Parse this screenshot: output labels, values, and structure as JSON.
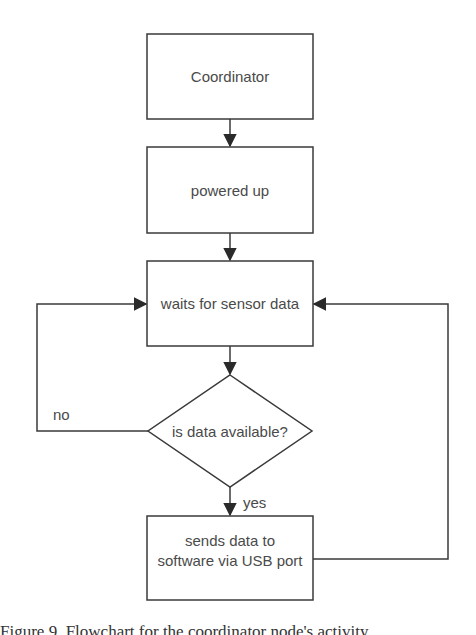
{
  "diagram": {
    "type": "flowchart",
    "colors": {
      "stroke": "#3a3a3a",
      "text": "#4a4a4a",
      "background": "#ffffff"
    },
    "nodes": [
      {
        "id": "n1",
        "shape": "rectangle",
        "label": "Coordinator"
      },
      {
        "id": "n2",
        "shape": "rectangle",
        "label": "powered up"
      },
      {
        "id": "n3",
        "shape": "rectangle",
        "label": "waits for sensor data"
      },
      {
        "id": "n4",
        "shape": "diamond",
        "label": "is data available?"
      },
      {
        "id": "n5",
        "shape": "rectangle",
        "label_lines": [
          "sends data to",
          "software via USB port"
        ]
      }
    ],
    "edges": [
      {
        "from": "n1",
        "to": "n2",
        "label": ""
      },
      {
        "from": "n2",
        "to": "n3",
        "label": ""
      },
      {
        "from": "n3",
        "to": "n4",
        "label": ""
      },
      {
        "from": "n4",
        "to": "n5",
        "label": "yes"
      },
      {
        "from": "n4",
        "to": "n3",
        "label": "no"
      },
      {
        "from": "n5",
        "to": "n3",
        "label": ""
      }
    ]
  },
  "caption": "Figure 9.   Flowchart for the coordinator node's activity"
}
